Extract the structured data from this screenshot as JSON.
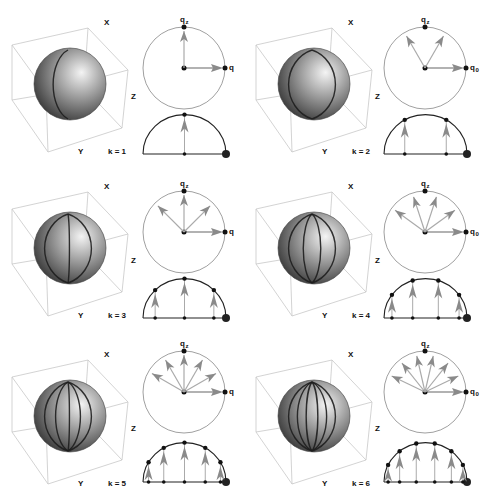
{
  "figure": {
    "colors": {
      "box_line": "#c8c8c8",
      "circle_line": "#888888",
      "semicircle_line": "#222222",
      "arrow": "#8a8a8a",
      "arrow_stem": "#aaaaaa",
      "point": "#111111",
      "sphere_light": "#f4f4f4",
      "sphere_mid": "#9a9a9a",
      "sphere_dark": "#2a2a2a",
      "meridian": "#1e1e1e"
    },
    "axis_labels": {
      "x": "X",
      "y": "Y",
      "z": "Z"
    },
    "top_label": {
      "main": "q",
      "sub": "z"
    },
    "panels": [
      {
        "k": 1,
        "k_label": "k = 1",
        "right_label_main": "q",
        "right_label_sub": "",
        "col": 0,
        "row": 0
      },
      {
        "k": 2,
        "k_label": "k = 2",
        "right_label_main": "q",
        "right_label_sub": "0",
        "col": 1,
        "row": 0
      },
      {
        "k": 3,
        "k_label": "k = 3",
        "right_label_main": "q",
        "right_label_sub": "",
        "col": 0,
        "row": 1
      },
      {
        "k": 4,
        "k_label": "k = 4",
        "right_label_main": "q",
        "right_label_sub": "0",
        "col": 1,
        "row": 1
      },
      {
        "k": 5,
        "k_label": "k = 5",
        "right_label_main": "q",
        "right_label_sub": "",
        "col": 0,
        "row": 2
      },
      {
        "k": 6,
        "k_label": "k = 6",
        "right_label_main": "q",
        "right_label_sub": "0",
        "col": 1,
        "row": 2
      }
    ]
  }
}
